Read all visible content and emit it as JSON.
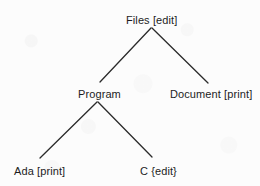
{
  "diagram": {
    "type": "tree",
    "line_color": "#2b2b2b",
    "text_color": "#1c1c1c",
    "background_color": "#fcfcfc",
    "nodes": {
      "root": {
        "label": "Files [edit]",
        "name": "Files",
        "annotation": "edit",
        "bracket_style": "square"
      },
      "program": {
        "label": "Program",
        "name": "Program",
        "annotation": "",
        "bracket_style": "none"
      },
      "document": {
        "label": "Document [print]",
        "name": "Document",
        "annotation": "print",
        "bracket_style": "square"
      },
      "ada": {
        "label": "Ada [print]",
        "name": "Ada",
        "annotation": "print",
        "bracket_style": "square"
      },
      "c": {
        "label": "C {edit}",
        "name": "C",
        "annotation": "edit",
        "bracket_style": "curly"
      }
    },
    "edges": [
      {
        "from": "root",
        "to": "program",
        "x1": 151,
        "y1": 28,
        "x2": 100,
        "y2": 82
      },
      {
        "from": "root",
        "to": "document",
        "x1": 152,
        "y1": 28,
        "x2": 208,
        "y2": 83
      },
      {
        "from": "program",
        "to": "ada",
        "x1": 97,
        "y1": 102,
        "x2": 40,
        "y2": 158
      },
      {
        "from": "program",
        "to": "c",
        "x1": 98,
        "y1": 102,
        "x2": 152,
        "y2": 157
      }
    ]
  }
}
